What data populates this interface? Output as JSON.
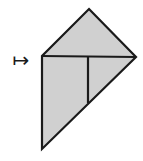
{
  "figure": {
    "background_color": "#ffffff",
    "fill_color": "#d0d0d0",
    "stroke_color": "#1a1a1a",
    "stroke_width": 2.2,
    "operator": {
      "name": "maps-to-arrow",
      "glyph": "↦",
      "label": "maps to"
    },
    "vertices": {
      "apex": {
        "x": 89,
        "y": 9
      },
      "left_corner": {
        "x": 42,
        "y": 56
      },
      "right_vertex": {
        "x": 136,
        "y": 57
      },
      "bottom_vertex": {
        "x": 42,
        "y": 149
      }
    },
    "outline_path": "M 89 9 L 136 57 L 42 149 L 42 56 Z",
    "internal_lines": [
      {
        "name": "horizontal-fold",
        "x1": 42,
        "y1": 56,
        "x2": 136,
        "y2": 57
      },
      {
        "name": "vertical-fold",
        "x1": 88,
        "y1": 57,
        "x2": 88,
        "y2": 103
      }
    ],
    "regions": [
      {
        "name": "upper-triangle",
        "fill": "#d0d0d0"
      },
      {
        "name": "lower-left-square",
        "fill": "#d0d0d0"
      },
      {
        "name": "lower-right-triangle",
        "fill": "#d0d0d0"
      }
    ]
  }
}
